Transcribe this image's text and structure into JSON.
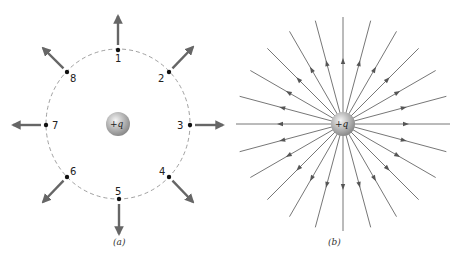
{
  "figure_a": {
    "caption": "(a)",
    "charge_label": "+q",
    "center": [
      118,
      124
    ],
    "circle_rx": 72,
    "circle_ry": 75,
    "points": [
      {
        "label": "1",
        "x": 118,
        "y": 50,
        "arrow_to": [
          118,
          16
        ],
        "label_pos": [
          115,
          62
        ]
      },
      {
        "label": "2",
        "x": 169,
        "y": 72,
        "arrow_to": [
          193,
          47
        ],
        "label_pos": [
          158,
          82
        ]
      },
      {
        "label": "3",
        "x": 190,
        "y": 125,
        "arrow_to": [
          223,
          125
        ],
        "label_pos": [
          177,
          129
        ]
      },
      {
        "label": "4",
        "x": 169,
        "y": 177,
        "arrow_to": [
          193,
          202
        ],
        "label_pos": [
          159,
          175
        ]
      },
      {
        "label": "5",
        "x": 119,
        "y": 199,
        "arrow_to": [
          119,
          234
        ],
        "label_pos": [
          115,
          195
        ]
      },
      {
        "label": "6",
        "x": 67,
        "y": 177,
        "arrow_to": [
          43,
          202
        ],
        "label_pos": [
          70,
          175
        ]
      },
      {
        "label": "7",
        "x": 46,
        "y": 125,
        "arrow_to": [
          13,
          125
        ],
        "label_pos": [
          52,
          129
        ]
      },
      {
        "label": "8",
        "x": 67,
        "y": 72,
        "arrow_to": [
          43,
          48
        ],
        "label_pos": [
          70,
          82
        ]
      }
    ],
    "colors": {
      "arrow": "#666666",
      "dashed_circle": "#888888",
      "point": "#111111"
    }
  },
  "figure_b": {
    "caption": "(b)",
    "charge_label": "+q",
    "center": [
      343,
      124
    ],
    "line_count": 24,
    "line_length": 107,
    "arrowhead_distance": 62,
    "colors": {
      "line": "#777777",
      "arrowhead": "#555555"
    }
  }
}
